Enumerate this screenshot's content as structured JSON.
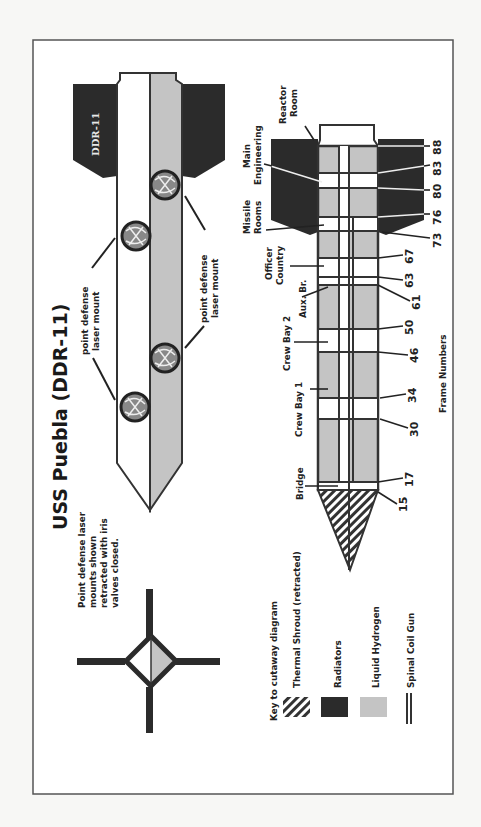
{
  "title": "USS Puebla (DDR-11)",
  "hull_marking": "DDR-11",
  "note": [
    "Point defense laser",
    "mounts shown",
    "retracted with iris",
    "valves closed."
  ],
  "mount_labels": [
    {
      "line1": "point defense",
      "line2": "laser mount"
    },
    {
      "line1": "point defense",
      "line2": "laser mount"
    }
  ],
  "compartments": [
    {
      "name": "Reactor Room",
      "line1": "Reactor",
      "line2": "Room"
    },
    {
      "name": "Main Engineering",
      "line1": "Main",
      "line2": "Engineering"
    },
    {
      "name": "Missile Rooms",
      "line1": "Missile",
      "line2": "Rooms"
    },
    {
      "name": "Officer Country",
      "line1": "Officer",
      "line2": "Country"
    },
    {
      "name": "Aux. Br.",
      "line1": "Aux. Br.",
      "line2": ""
    },
    {
      "name": "Crew Bay 2",
      "line1": "Crew Bay 2",
      "line2": ""
    },
    {
      "name": "Crew Bay 1",
      "line1": "Crew Bay 1",
      "line2": ""
    },
    {
      "name": "Bridge",
      "line1": "Bridge",
      "line2": ""
    }
  ],
  "frames": [
    "88",
    "83",
    "80",
    "76",
    "73",
    "67",
    "63",
    "61",
    "50",
    "46",
    "34",
    "30",
    "17",
    "15"
  ],
  "frames_label": "Frame Numbers",
  "legend": {
    "title": "Key to cutaway diagram",
    "items": [
      {
        "label": "Thermal Shroud (retracted)",
        "swatch": "hatch"
      },
      {
        "label": "Radiators",
        "swatch": "solid",
        "color": "#2b2b2b"
      },
      {
        "label": "Liquid Hydrogen",
        "swatch": "solid",
        "color": "#c4c4c4"
      },
      {
        "label": "Spinal Coil Gun",
        "swatch": "line"
      }
    ]
  },
  "colors": {
    "radiator": "#2b2b2b",
    "hydrogen": "#c4c4c4",
    "outline": "#333333",
    "paper": "#ffffff"
  }
}
